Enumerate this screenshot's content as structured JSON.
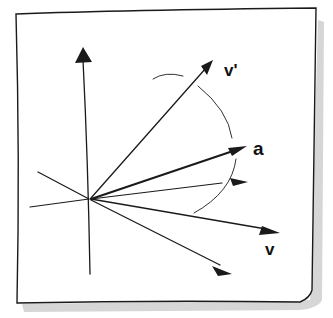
{
  "diagram": {
    "colors": {
      "ink": "#1a1a1a",
      "paper": "#ffffff",
      "shadow": "#b8b8b8"
    },
    "labels": {
      "v_prime": "v'",
      "a": "a",
      "v": "v"
    },
    "vectors": [
      {
        "name": "vertical-axis",
        "label": ""
      },
      {
        "name": "v-prime",
        "label": "v'"
      },
      {
        "name": "a",
        "label": "a"
      },
      {
        "name": "intermediate",
        "label": ""
      },
      {
        "name": "v",
        "label": "v"
      },
      {
        "name": "lower",
        "label": ""
      }
    ]
  }
}
